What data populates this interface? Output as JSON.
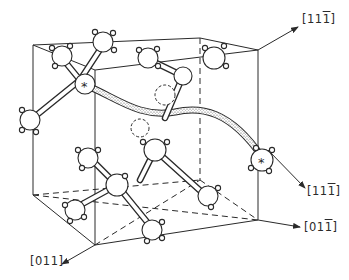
{
  "figure": {
    "type": "crystal-lattice-diagram",
    "colors": {
      "ink": "#2a2a2a",
      "paper": "#ffffff",
      "path_fill": "#e6e6e6"
    }
  },
  "labels": {
    "top_right": {
      "open": "[",
      "d1": "1",
      "d2": "1",
      "d3": "1",
      "close": "]",
      "bar": [
        false,
        false,
        true
      ]
    },
    "mid_right": {
      "open": "[",
      "d1": "1",
      "d2": "1",
      "d3": "1",
      "close": "]",
      "bar": [
        false,
        false,
        true
      ]
    },
    "bottom_right": {
      "open": "[",
      "d1": "0",
      "d2": "1",
      "d3": "1",
      "close": "]",
      "bar": [
        false,
        false,
        true
      ]
    },
    "bottom_left": {
      "open": "[",
      "d1": "0",
      "d2": "1",
      "d3": "1",
      "close": "]",
      "bar": [
        false,
        false,
        false
      ]
    }
  },
  "markers": {
    "star": "*"
  },
  "legend_semantics": {
    "starred_atom": "marked atom (*)",
    "dashed_circle": "vacancy site",
    "dotted_tube": "migration path"
  }
}
